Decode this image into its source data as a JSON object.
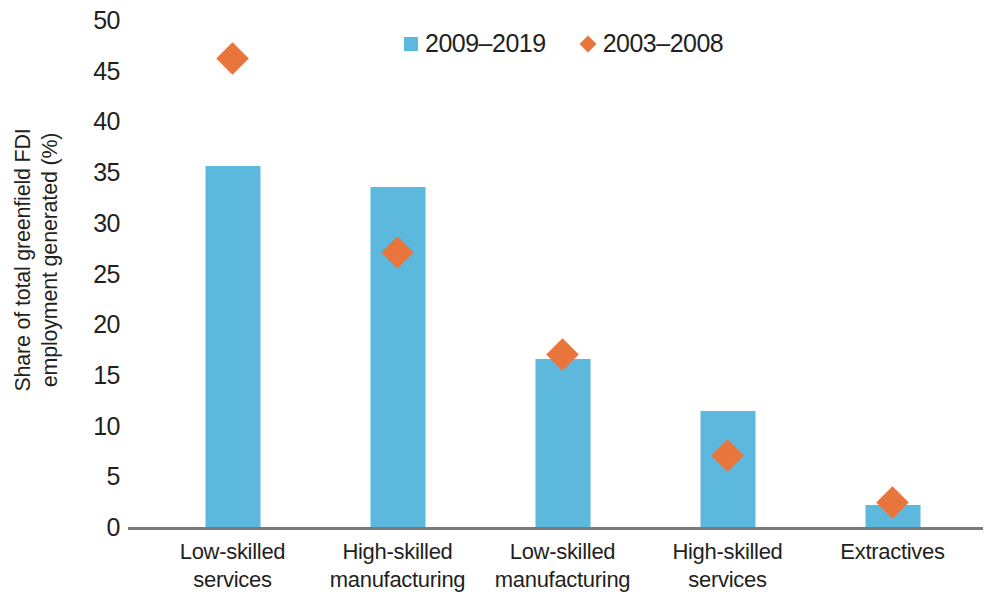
{
  "chart_data": {
    "type": "bar",
    "title": "",
    "subtitle": "",
    "xlabel": "",
    "ylabel": "Share of total greenfield FDI employment generated (%)",
    "ylabel_lines": [
      "Share of total greenfield FDI",
      "employment generated (%)"
    ],
    "categories": [
      "Low-skilled services",
      "High-skilled manufacturing",
      "Low-skilled manufacturing",
      "High-skilled services",
      "Extractives"
    ],
    "category_lines": [
      [
        "Low-skilled",
        "services"
      ],
      [
        "High-skilled",
        "manufacturing"
      ],
      [
        "Low-skilled",
        "manufacturing"
      ],
      [
        "High-skilled",
        "services"
      ],
      [
        "Extractives"
      ]
    ],
    "series": [
      {
        "name": "2009–2019",
        "marker": "bar",
        "color": "#5cb8dc",
        "values": [
          35.6,
          33.5,
          16.6,
          11.4,
          2.2
        ]
      },
      {
        "name": "2003–2008",
        "marker": "diamond",
        "color": "#e8763c",
        "values": [
          46.2,
          27.1,
          17.0,
          7.1,
          2.4
        ]
      }
    ],
    "ylim": [
      0,
      50
    ],
    "ytick_step": 5,
    "yticks": [
      "50",
      "45",
      "40",
      "35",
      "30",
      "25",
      "20",
      "15",
      "10",
      "5",
      "0"
    ],
    "grid": false,
    "legend_position": "top-center"
  },
  "legend": {
    "items": [
      {
        "label": "2009–2019",
        "marker": "square",
        "color": "#5cb8dc"
      },
      {
        "label": "2003–2008",
        "marker": "diamond",
        "color": "#e8763c"
      }
    ]
  },
  "colors": {
    "bar": "#5cb8dc",
    "diamond": "#e8763c",
    "axis": "#7a7a7a",
    "text": "#231f20",
    "background": "#ffffff"
  }
}
